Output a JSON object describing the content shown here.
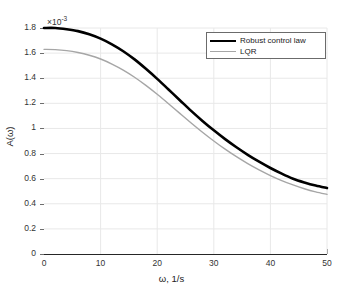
{
  "chart_data": {
    "type": "line",
    "title": "",
    "xlabel": "ω, 1/s",
    "ylabel": "A(ω)",
    "y_exponent_mantissa": "×10",
    "y_exponent_power": "-3",
    "xlim": [
      0,
      50
    ],
    "ylim": [
      0,
      1.8
    ],
    "xticks": [
      0,
      10,
      20,
      30,
      40,
      50
    ],
    "xtick_labels": [
      "0",
      "10",
      "20",
      "30",
      "40",
      "50"
    ],
    "yticks": [
      0,
      0.2,
      0.4,
      0.6,
      0.8,
      1,
      1.2,
      1.4,
      1.6,
      1.8
    ],
    "ytick_labels": [
      "0",
      "0.2",
      "0.4",
      "0.6",
      "0.8",
      "1",
      "1.2",
      "1.4",
      "1.6",
      "1.8"
    ],
    "grid": true,
    "legend_position": "upper right",
    "series": [
      {
        "name": "Robust control law",
        "color": "#000000",
        "line_width": 2.6,
        "x": [
          0,
          2,
          4,
          6,
          8,
          10,
          12,
          14,
          16,
          18,
          20,
          22,
          24,
          26,
          28,
          30,
          32,
          34,
          36,
          38,
          40,
          42,
          44,
          46,
          48,
          50
        ],
        "values": [
          1.8,
          1.8,
          1.79,
          1.775,
          1.75,
          1.715,
          1.67,
          1.615,
          1.55,
          1.475,
          1.395,
          1.31,
          1.225,
          1.14,
          1.06,
          0.985,
          0.915,
          0.85,
          0.79,
          0.735,
          0.685,
          0.64,
          0.6,
          0.57,
          0.545,
          0.525
        ]
      },
      {
        "name": "LQR",
        "color": "#a6a6a6",
        "line_width": 1.4,
        "x": [
          0,
          2,
          4,
          6,
          8,
          10,
          12,
          14,
          16,
          18,
          20,
          22,
          24,
          26,
          28,
          30,
          32,
          34,
          36,
          38,
          40,
          42,
          44,
          46,
          48,
          50
        ],
        "values": [
          1.63,
          1.628,
          1.62,
          1.605,
          1.583,
          1.553,
          1.513,
          1.465,
          1.408,
          1.343,
          1.272,
          1.197,
          1.12,
          1.044,
          0.97,
          0.9,
          0.835,
          0.775,
          0.72,
          0.67,
          0.625,
          0.585,
          0.55,
          0.52,
          0.495,
          0.475
        ]
      }
    ]
  },
  "legend": {
    "items": [
      {
        "label": "Robust control law"
      },
      {
        "label": "LQR"
      }
    ]
  },
  "colors": {
    "robust": "#000000",
    "lqr": "#a6a6a6",
    "grid": "#e8e8e8",
    "axis": "#262626",
    "background": "#ffffff"
  }
}
